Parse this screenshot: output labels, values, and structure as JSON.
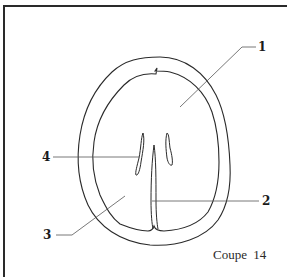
{
  "figure": {
    "caption": "Coupe 14",
    "labels": [
      {
        "id": "1",
        "text": "1"
      },
      {
        "id": "2",
        "text": "2"
      },
      {
        "id": "3",
        "text": "3"
      },
      {
        "id": "4",
        "text": "4"
      }
    ],
    "colors": {
      "stroke": "#2a2a2a",
      "leader": "#555555",
      "background": "#ffffff"
    }
  }
}
